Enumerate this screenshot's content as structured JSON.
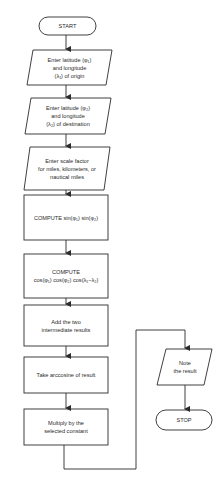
{
  "flowchart": {
    "start": "START",
    "steps": [
      {
        "type": "input",
        "label": "Enter latitude (φ₁)\nand longitude\n(λ₁) of origin"
      },
      {
        "type": "input",
        "label": "Enter latitude (φ₂)\nand longitude\n(λ₂) of destination"
      },
      {
        "type": "input",
        "label": "Enter scale factor\nfor miles, kilometers, or\nnautical miles"
      },
      {
        "type": "process",
        "label": "COMPUTE sin(φ₁) sin(φ₂)"
      },
      {
        "type": "process",
        "label": "COMPUTE\ncos(φ₁) cos(φ₂) cos(λ₁−λ₂)"
      },
      {
        "type": "process",
        "label": "Add the two\nintermediate results"
      },
      {
        "type": "process",
        "label": "Take arccosine of result"
      },
      {
        "type": "process",
        "label": "Multiply by the\nselected constant"
      },
      {
        "type": "output",
        "label": "Note\nthe result"
      }
    ],
    "stop": "STOP"
  },
  "colors": {
    "line": "#2b2b2b",
    "background": "#ffffff"
  }
}
